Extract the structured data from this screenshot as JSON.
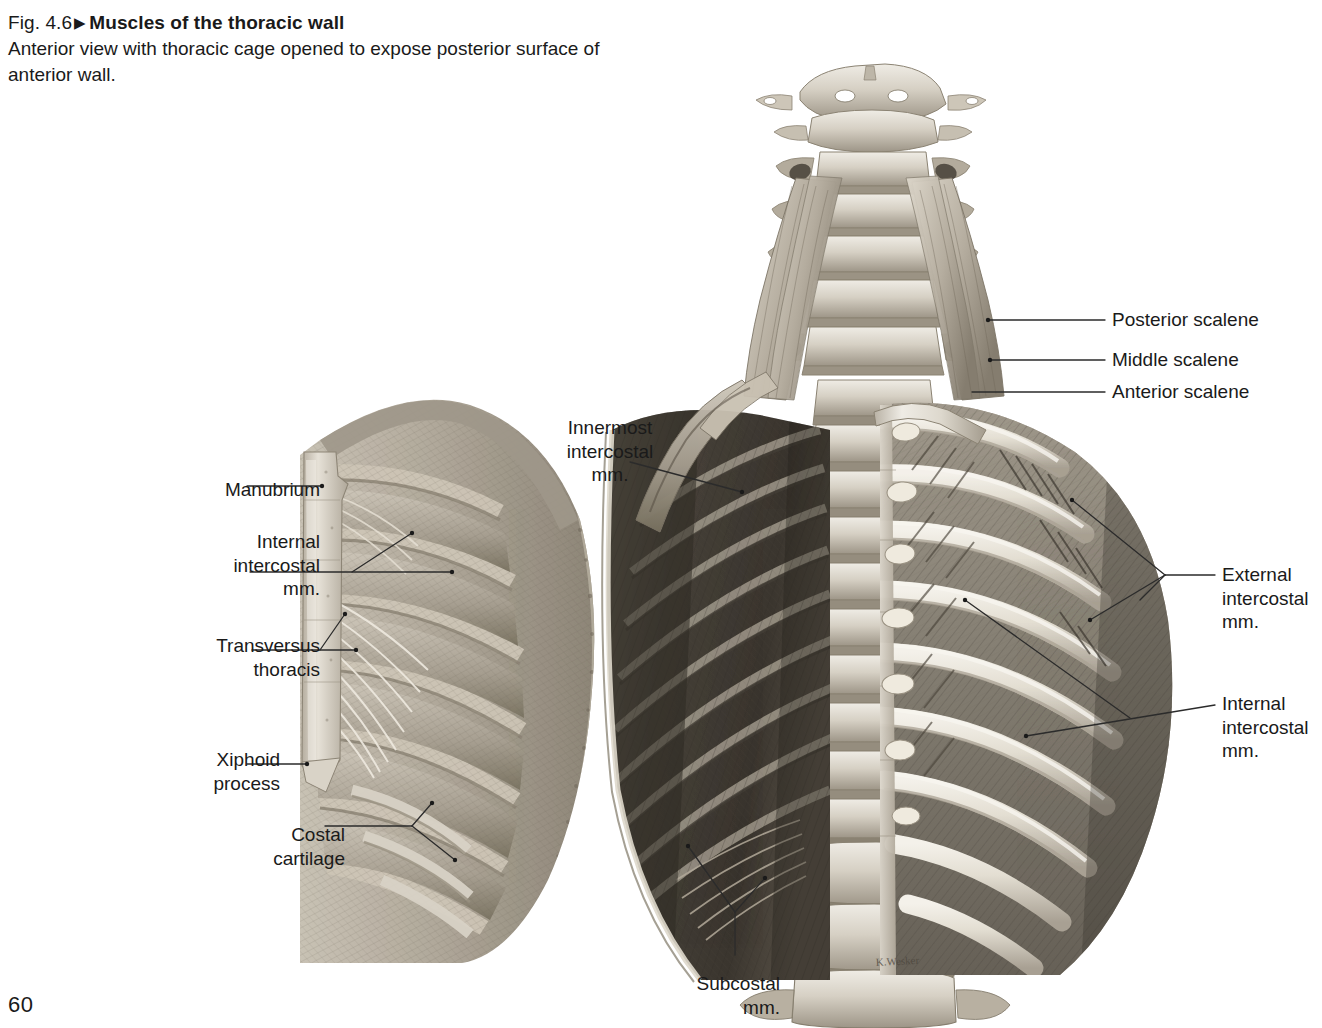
{
  "page": {
    "number": "60",
    "background": "#ffffff",
    "ink": "#1a1a1a"
  },
  "caption": {
    "figure_number": "Fig. 4.6",
    "arrow": "▶",
    "title": "Muscles of the thoracic wall",
    "subtitle": "Anterior view with thoracic cage opened to expose\nposterior surface of anterior wall."
  },
  "labels": {
    "manubrium": {
      "text": "Manubrium",
      "align": "right",
      "x": 155,
      "y": 478,
      "w": 165
    },
    "internal_intercostal_left": {
      "text": "Internal\nintercostal\nmm.",
      "align": "right",
      "x": 155,
      "y": 530,
      "w": 165
    },
    "transversus_thoracis": {
      "text": "Transversus\nthoracis",
      "align": "right",
      "x": 145,
      "y": 634,
      "w": 175
    },
    "xiphoid_process": {
      "text": "Xiphoid\nprocess",
      "align": "right",
      "x": 155,
      "y": 748,
      "w": 125
    },
    "costal_cartilage": {
      "text": "Costal\ncartilage",
      "align": "right",
      "x": 215,
      "y": 823,
      "w": 130
    },
    "innermost_intercostal": {
      "text": "Innermost\nintercostal\nmm.",
      "align": "center",
      "x": 520,
      "y": 416,
      "w": 180
    },
    "subcostal": {
      "text": "Subcostal\nmm.",
      "align": "right",
      "x": 655,
      "y": 972,
      "w": 125
    },
    "posterior_scalene": {
      "text": "Posterior scalene",
      "align": "left",
      "x": 1112,
      "y": 308,
      "w": 200
    },
    "middle_scalene": {
      "text": "Middle scalene",
      "align": "left",
      "x": 1112,
      "y": 348,
      "w": 200
    },
    "anterior_scalene": {
      "text": "Anterior scalene",
      "align": "left",
      "x": 1112,
      "y": 380,
      "w": 200
    },
    "external_intercostal_right": {
      "text": "External\nintercostal\nmm.",
      "align": "left",
      "x": 1222,
      "y": 563,
      "w": 125
    },
    "internal_intercostal_right": {
      "text": "Internal\nintercostal\nmm.",
      "align": "left",
      "x": 1222,
      "y": 692,
      "w": 125
    }
  },
  "leader_lines": {
    "stroke": "#2b2b2b",
    "stroke_width": 1.3,
    "dot_radius": 2.2,
    "lines": [
      {
        "name": "manubrium-leader",
        "points": "247,486 322,486",
        "dot": "322,486"
      },
      {
        "name": "internal-intercostal-left-leader",
        "points": "250,572 452,572",
        "dot": "452,572"
      },
      {
        "name": "internal-intercostal-left-branch",
        "points": "352,572 412,533",
        "dot": "412,533"
      },
      {
        "name": "transversus-thoracis-leader",
        "points": "252,650 356,650",
        "dot": "356,650"
      },
      {
        "name": "transversus-thoracis-branch",
        "points": "320,650 345,614",
        "dot": "345,614"
      },
      {
        "name": "xiphoid-leader",
        "points": "247,764 307,764",
        "dot": "307,764"
      },
      {
        "name": "costal-cartilage-leader",
        "points": "325,826 412,826",
        "dot": null
      },
      {
        "name": "costal-cartilage-branch-up",
        "points": "412,826 432,803",
        "dot": "432,803"
      },
      {
        "name": "costal-cartilage-branch-down",
        "points": "412,826 455,860",
        "dot": "455,860"
      },
      {
        "name": "innermost-intercostal-leader",
        "points": "630,462 742,492",
        "dot": "742,492"
      },
      {
        "name": "subcostal-leader",
        "points": "735,955 735,912",
        "dot": null
      },
      {
        "name": "subcostal-branch-a",
        "points": "735,912 688,846",
        "dot": "688,846"
      },
      {
        "name": "subcostal-branch-b",
        "points": "735,912 765,878",
        "dot": "765,878"
      },
      {
        "name": "posterior-scalene-leader",
        "points": "988,320 1105,320",
        "dot": "988,320"
      },
      {
        "name": "middle-scalene-leader",
        "points": "990,360 1105,360",
        "dot": "990,360"
      },
      {
        "name": "anterior-scalene-leader",
        "points": "972,392 1105,392",
        "dot": null
      },
      {
        "name": "external-intercostal-leader",
        "points": "1165,575 1215,575",
        "dot": null
      },
      {
        "name": "external-intercostal-branch-a",
        "points": "1165,575 1072,500",
        "dot": "1072,500"
      },
      {
        "name": "external-intercostal-branch-b",
        "points": "1165,575 1090,620",
        "dot": "1090,620"
      },
      {
        "name": "external-intercostal-branch-c",
        "points": "1165,575 1140,600",
        "dot": null
      },
      {
        "name": "internal-intercostal-right-leader",
        "points": "1026,736 1215,705",
        "dot": "1026,736"
      },
      {
        "name": "internal-intercostal-right-branch",
        "points": "1130,718 965,600",
        "dot": "965,600"
      }
    ]
  },
  "illustration": {
    "description": "Grayscale anatomical halftone of opened thoracic cage, anterior view",
    "tones": {
      "bone_light": "#e8e4dc",
      "bone_mid": "#cfc9bd",
      "bone_shadow": "#a79f91",
      "muscle_light": "#bfb8ab",
      "muscle_mid": "#8d867a",
      "muscle_dark": "#5c564c",
      "cavity_dark": "#403c35",
      "deep_shadow": "#2a2721",
      "outline": "#6b6458"
    },
    "parts": [
      {
        "name": "cervical-vertebrae",
        "count": 7
      },
      {
        "name": "thoracic-vertebrae",
        "count": 12
      },
      {
        "name": "lumbar-vertebrae",
        "count": 3
      },
      {
        "name": "left-anterior-chest-wall-flap",
        "ribs": 7
      },
      {
        "name": "right-rib-cage",
        "ribs": 10
      },
      {
        "name": "posterior-rib-cage-interior",
        "ribs": 10
      },
      {
        "name": "scalene-muscles",
        "count": 3
      },
      {
        "name": "sternum-manubrium"
      },
      {
        "name": "xiphoid-process"
      },
      {
        "name": "costal-cartilages"
      },
      {
        "name": "transversus-thoracis"
      },
      {
        "name": "subcostal-muscles"
      }
    ],
    "signature": "K. Wesker"
  }
}
